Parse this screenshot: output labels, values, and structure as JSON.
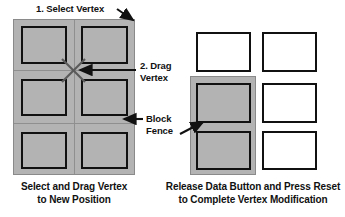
{
  "figure": {
    "type": "instructional-diagram",
    "title_visible": false
  },
  "annotations": [
    {
      "id": "select-vertex",
      "label": "1. Select Vertex"
    },
    {
      "id": "drag-vertex",
      "label": "2. Drag\nVertex"
    },
    {
      "id": "block-fence",
      "label": "Block\nFence"
    }
  ],
  "captions": [
    {
      "id": "left-caption",
      "text": "Select and Drag Vertex\nto New Position"
    },
    {
      "id": "right-caption",
      "text": "Release Data Button and Press Reset\nto Complete Vertex Modification"
    }
  ],
  "left_panel": {
    "name": "Select and Drag Vertex",
    "fence": {
      "fill": "#b3b3b3",
      "stroke": "#8a8a8a",
      "columns": 2,
      "rows": 3
    },
    "vertex_marker": {
      "shape": "x-cross",
      "x": 73,
      "y": 70,
      "stroke": "#555555"
    },
    "blocks": [
      {
        "id": "block-r1c1",
        "state": "selected"
      },
      {
        "id": "block-r1c2",
        "state": "selected"
      },
      {
        "id": "block-r2c1",
        "state": "selected"
      },
      {
        "id": "block-r2c2",
        "state": "selected"
      },
      {
        "id": "block-r3c1",
        "state": "selected"
      },
      {
        "id": "block-r3c2",
        "state": "selected"
      }
    ]
  },
  "right_panel": {
    "name": "Release Data Button and Press Reset",
    "fence": {
      "fill": "#b3b3b3",
      "stroke": "#8a8a8a",
      "covers": [
        "block-r2c1",
        "block-r3c1"
      ]
    },
    "blocks": [
      {
        "id": "block-r1c1",
        "state": "released"
      },
      {
        "id": "block-r1c2",
        "state": "released"
      },
      {
        "id": "block-r2c1",
        "state": "fenced"
      },
      {
        "id": "block-r2c2",
        "state": "released"
      },
      {
        "id": "block-r3c1",
        "state": "fenced"
      },
      {
        "id": "block-r3c2",
        "state": "released"
      }
    ]
  },
  "colors": {
    "fence_fill": "#b3b3b3",
    "fence_stroke": "#8a8a8a",
    "block_stroke": "#111111",
    "block_fill_released": "#ffffff",
    "background": "#ffffff",
    "text": "#111111",
    "vertex_stroke": "#555555"
  }
}
